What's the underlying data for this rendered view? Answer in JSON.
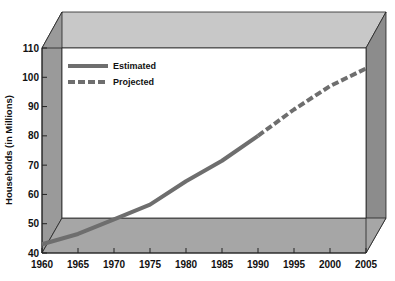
{
  "chart_data": {
    "type": "line",
    "title": "",
    "xlabel": "",
    "ylabel": "Households (in Millions)",
    "xlim": [
      1960,
      2005
    ],
    "ylim": [
      40,
      110
    ],
    "x_ticks": [
      1960,
      1965,
      1970,
      1975,
      1980,
      1985,
      1990,
      1995,
      2000,
      2005
    ],
    "y_ticks": [
      40,
      50,
      60,
      70,
      80,
      90,
      100,
      110
    ],
    "legend_position": "upper left",
    "grid": false,
    "series": [
      {
        "name": "Estimated",
        "style": "solid",
        "color": "#6e6e6e",
        "x": [
          1960,
          1965,
          1970,
          1975,
          1980,
          1985,
          1990
        ],
        "values": [
          43,
          46.5,
          51.5,
          56.5,
          64.5,
          71.5,
          80
        ]
      },
      {
        "name": "Projected",
        "style": "dashed",
        "color": "#6e6e6e",
        "x": [
          1990,
          1995,
          2000,
          2005
        ],
        "values": [
          80,
          89,
          97,
          103
        ]
      }
    ]
  },
  "legend": {
    "estimated": "Estimated",
    "projected": "Projected"
  },
  "axis": {
    "ylabel": "Households (in Millions)"
  }
}
